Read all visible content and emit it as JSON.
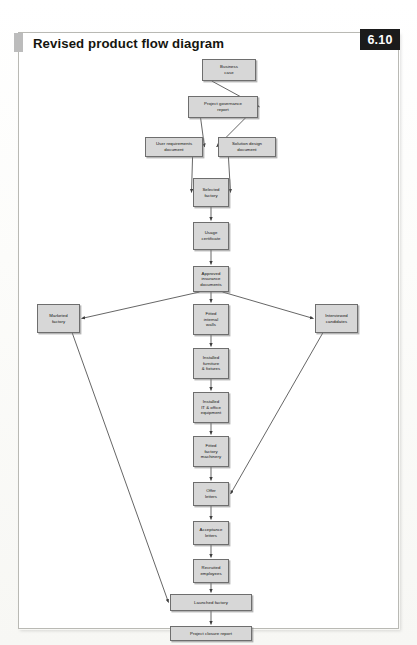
{
  "header": {
    "title": "Revised product flow diagram",
    "badge": "6.10",
    "marker_icon": "gray-square-marker"
  },
  "colors": {
    "node_fill": "#d7d7d7",
    "node_border": "#6e6e6e",
    "badge_bg": "#1b1b1b",
    "badge_text": "#ffffff",
    "frame_border": "#b9b9b4",
    "page_bg": "#ffffff",
    "connector": "#4a4a4a"
  },
  "diagram": {
    "type": "flowchart",
    "orientation": "top-to-bottom",
    "nodes": [
      {
        "id": "business_case",
        "label": "Business\ncase",
        "x": 184,
        "y": 27,
        "w": 54,
        "h": 22
      },
      {
        "id": "project_governance",
        "label": "Project governance\nreport",
        "x": 170,
        "y": 64,
        "w": 70,
        "h": 22
      },
      {
        "id": "user_requirements",
        "label": "User requirements\ndocument",
        "x": 127,
        "y": 105,
        "w": 58,
        "h": 20
      },
      {
        "id": "solution_design",
        "label": "Solution design\ndocument",
        "x": 200,
        "y": 105,
        "w": 58,
        "h": 20
      },
      {
        "id": "selected_factory",
        "label": "Selected\nfactory",
        "x": 175,
        "y": 146,
        "w": 36,
        "h": 29
      },
      {
        "id": "usage_certificate",
        "label": "Usage\ncertificate",
        "x": 175,
        "y": 190,
        "w": 36,
        "h": 28
      },
      {
        "id": "approved_insurance",
        "label": "Approved\ninsurance\ndocuments",
        "x": 175,
        "y": 234,
        "w": 36,
        "h": 26
      },
      {
        "id": "marketed_factory",
        "label": "Marketed\nfactory",
        "x": 19,
        "y": 272,
        "w": 43,
        "h": 29
      },
      {
        "id": "interviewed_candidates",
        "label": "Interviewed\ncandidates",
        "x": 297,
        "y": 272,
        "w": 43,
        "h": 29
      },
      {
        "id": "fitted_internal_walls",
        "label": "Fitted\ninternal\nwalls",
        "x": 175,
        "y": 272,
        "w": 36,
        "h": 31
      },
      {
        "id": "installed_furniture",
        "label": "Installed\nfurniture\n& fixtures",
        "x": 175,
        "y": 316,
        "w": 36,
        "h": 31
      },
      {
        "id": "installed_it",
        "label": "Installed\nIT & office\nequipment",
        "x": 175,
        "y": 360,
        "w": 36,
        "h": 31
      },
      {
        "id": "fitted_machinery",
        "label": "Fitted\nfactory\nmachinery",
        "x": 175,
        "y": 404,
        "w": 36,
        "h": 31
      },
      {
        "id": "offer_letters",
        "label": "Offer\nletters",
        "x": 175,
        "y": 450,
        "w": 36,
        "h": 24
      },
      {
        "id": "acceptance_letters",
        "label": "Acceptance\nletters",
        "x": 175,
        "y": 489,
        "w": 36,
        "h": 24
      },
      {
        "id": "recruited_employees",
        "label": "Recruited\nemployees",
        "x": 175,
        "y": 527,
        "w": 36,
        "h": 24
      },
      {
        "id": "launched_factory",
        "label": "Launched factory",
        "x": 152,
        "y": 562,
        "w": 82,
        "h": 17
      },
      {
        "id": "project_closure",
        "label": "Project closure report",
        "x": 152,
        "y": 594,
        "w": 82,
        "h": 15
      }
    ],
    "edges": [
      {
        "from": "business_case",
        "to": "project_governance"
      },
      {
        "from": "project_governance",
        "to": "user_requirements"
      },
      {
        "from": "project_governance",
        "to": "solution_design"
      },
      {
        "from": "user_requirements",
        "to": "selected_factory"
      },
      {
        "from": "solution_design",
        "to": "selected_factory"
      },
      {
        "from": "selected_factory",
        "to": "usage_certificate"
      },
      {
        "from": "usage_certificate",
        "to": "approved_insurance"
      },
      {
        "from": "approved_insurance",
        "to": "marketed_factory"
      },
      {
        "from": "approved_insurance",
        "to": "fitted_internal_walls"
      },
      {
        "from": "approved_insurance",
        "to": "interviewed_candidates"
      },
      {
        "from": "fitted_internal_walls",
        "to": "installed_furniture"
      },
      {
        "from": "installed_furniture",
        "to": "installed_it"
      },
      {
        "from": "installed_it",
        "to": "fitted_machinery"
      },
      {
        "from": "fitted_machinery",
        "to": "offer_letters"
      },
      {
        "from": "interviewed_candidates",
        "to": "offer_letters"
      },
      {
        "from": "offer_letters",
        "to": "acceptance_letters"
      },
      {
        "from": "acceptance_letters",
        "to": "recruited_employees"
      },
      {
        "from": "recruited_employees",
        "to": "launched_factory"
      },
      {
        "from": "marketed_factory",
        "to": "launched_factory"
      },
      {
        "from": "launched_factory",
        "to": "project_closure"
      }
    ]
  }
}
